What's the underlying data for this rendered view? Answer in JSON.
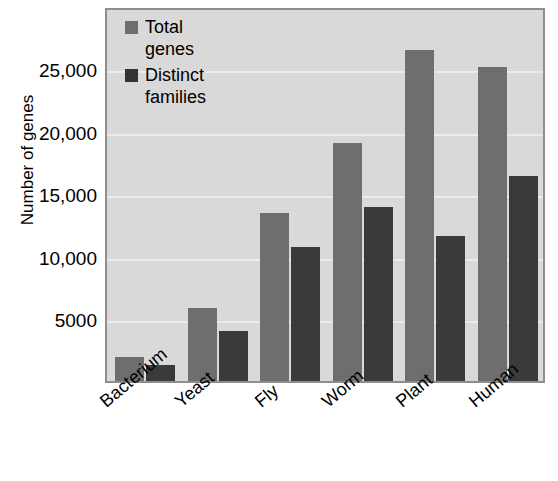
{
  "chart_data": {
    "type": "bar",
    "title": "",
    "xlabel": "",
    "ylabel": "Number of genes",
    "categories": [
      "Bacterium",
      "Yeast",
      "Fly",
      "Worm",
      "Plant",
      "Human"
    ],
    "series": [
      {
        "name": "Total genes",
        "color": "#6e6e6e",
        "values": [
          1900,
          5800,
          13400,
          19000,
          26400,
          25100
        ]
      },
      {
        "name": "Distinct families",
        "color": "#3a3a3a",
        "values": [
          1300,
          4000,
          10700,
          13900,
          11600,
          16400
        ]
      }
    ],
    "ylim": [
      0,
      30000
    ],
    "yticks": [
      5000,
      10000,
      15000,
      20000,
      25000
    ],
    "ytick_labels": [
      "5000",
      "10,000",
      "15,000",
      "20,000",
      "25,000"
    ],
    "grid": true,
    "legend_position": "top-left-inside",
    "plot_background": "#d9d9d9",
    "frame_color": "#8e8e8e",
    "gridline_color": "#eceaea"
  },
  "axes": {
    "y_title": "Number of genes"
  },
  "legend": {
    "entries": [
      {
        "label": "Total\ngenes",
        "swatch": "#6e6e6e"
      },
      {
        "label": "Distinct\nfamilies",
        "swatch": "#333333"
      }
    ]
  }
}
